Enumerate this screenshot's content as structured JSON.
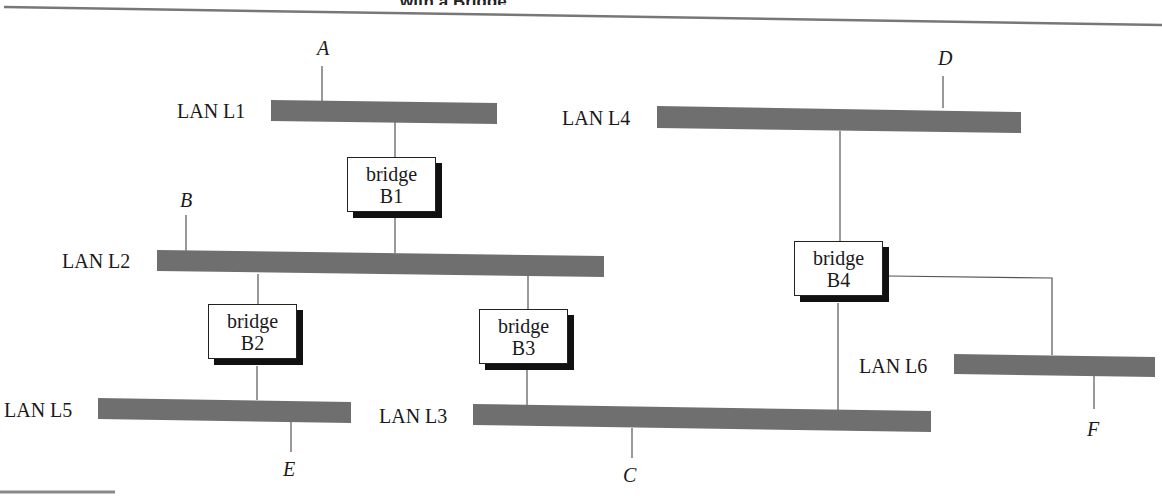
{
  "header": {
    "title_fragment": "with a Bridge"
  },
  "lans": [
    {
      "id": "L1",
      "label": "LAN L1"
    },
    {
      "id": "L2",
      "label": "LAN L2"
    },
    {
      "id": "L3",
      "label": "LAN L3"
    },
    {
      "id": "L4",
      "label": "LAN L4"
    },
    {
      "id": "L5",
      "label": "LAN L5"
    },
    {
      "id": "L6",
      "label": "LAN L6"
    }
  ],
  "bridges": [
    {
      "id": "B1",
      "word": "bridge",
      "name": "B1",
      "connects": [
        "L1",
        "L2"
      ]
    },
    {
      "id": "B2",
      "word": "bridge",
      "name": "B2",
      "connects": [
        "L2",
        "L5"
      ]
    },
    {
      "id": "B3",
      "word": "bridge",
      "name": "B3",
      "connects": [
        "L2",
        "L3"
      ]
    },
    {
      "id": "B4",
      "word": "bridge",
      "name": "B4",
      "connects": [
        "L4",
        "L3",
        "L6"
      ]
    }
  ],
  "hosts": [
    {
      "id": "A",
      "label": "A",
      "lan": "L1"
    },
    {
      "id": "B",
      "label": "B",
      "lan": "L2"
    },
    {
      "id": "C",
      "label": "C",
      "lan": "L3"
    },
    {
      "id": "D",
      "label": "D",
      "lan": "L4"
    },
    {
      "id": "E",
      "label": "E",
      "lan": "L5"
    },
    {
      "id": "F",
      "label": "F",
      "lan": "L6"
    }
  ],
  "colors": {
    "lan_bar": "#6f6f6f",
    "wire": "#555555",
    "shadow": "#111111",
    "rule": "#777777"
  }
}
